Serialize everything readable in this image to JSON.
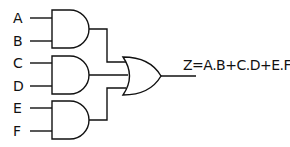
{
  "diagram": {
    "type": "logic-circuit",
    "inputs": [
      {
        "label": "A",
        "gate": "and1"
      },
      {
        "label": "B",
        "gate": "and1"
      },
      {
        "label": "C",
        "gate": "and2"
      },
      {
        "label": "D",
        "gate": "and2"
      },
      {
        "label": "E",
        "gate": "and3"
      },
      {
        "label": "F",
        "gate": "and3"
      }
    ],
    "gates": [
      {
        "id": "and1",
        "type": "AND"
      },
      {
        "id": "and2",
        "type": "AND"
      },
      {
        "id": "and3",
        "type": "AND"
      },
      {
        "id": "or1",
        "type": "OR",
        "inputs": [
          "and1",
          "and2",
          "and3"
        ]
      }
    ],
    "output": {
      "expression": "Z=A.B+C.D+E.F"
    }
  }
}
